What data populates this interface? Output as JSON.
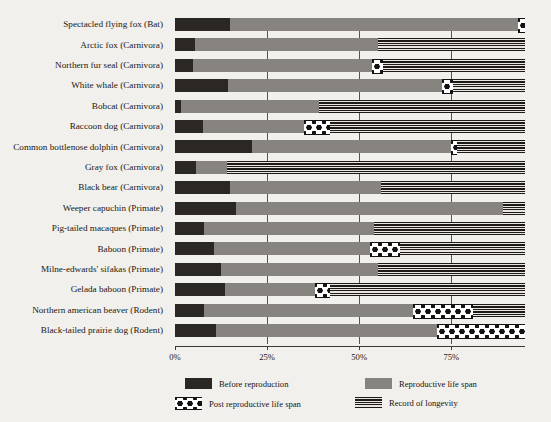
{
  "chart_data": {
    "type": "bar",
    "subtype": "stacked-horizontal",
    "title": "",
    "xlabel": "",
    "ylabel": "",
    "xlim": [
      0,
      95
    ],
    "xticks": [
      0,
      25,
      50,
      75
    ],
    "xtick_labels": [
      "0%",
      "25%",
      "50%",
      "75%"
    ],
    "grid": true,
    "legend_position": "bottom",
    "series": [
      {
        "name": "Before reproduction",
        "key": "before",
        "color": "#2b2724"
      },
      {
        "name": "Reproductive life span",
        "key": "repro",
        "color": "#87837e"
      },
      {
        "name": "Post reproductive life span",
        "key": "post",
        "color": "#ffffff"
      },
      {
        "name": "Record of longevity",
        "key": "longev",
        "color": "#1d1a17"
      }
    ],
    "categories": [
      "Spectacled flying fox (Bat)",
      "Arctic fox (Carnivora)",
      "Northern fur seal (Carnivora)",
      "White whale (Carnivora)",
      "Bobcat (Carnivora)",
      "Raccoon dog (Carnivora)",
      "Common bottlenose dolphin (Carnivora)",
      "Gray fox (Carnivora)",
      "Black bear (Carnivora)",
      "Weeper capuchin (Primate)",
      "Pig-tailed macaques (Primate)",
      "Baboon (Primate)",
      "Milne-edwards' sifakas (Primate)",
      "Gelada baboon (Primate)",
      "Northern american beaver (Rodent)",
      "Black-tailed prairie dog (Rodent)"
    ],
    "rows": [
      {
        "label": "Spectacled flying fox (Bat)",
        "before": 15.0,
        "repro": 78.0,
        "post": 2.0,
        "longev": 0.0
      },
      {
        "label": "Arctic fox (Carnivora)",
        "before": 5.5,
        "repro": 49.5,
        "post": 0.0,
        "longev": 40.0
      },
      {
        "label": "Northern fur seal (Carnivora)",
        "before": 5.0,
        "repro": 48.5,
        "post": 3.0,
        "longev": 38.5
      },
      {
        "label": "White whale (Carnivora)",
        "before": 14.5,
        "repro": 58.0,
        "post": 3.0,
        "longev": 19.5
      },
      {
        "label": "Bobcat (Carnivora)",
        "before": 1.7,
        "repro": 37.3,
        "post": 0.0,
        "longev": 56.0
      },
      {
        "label": "Raccoon dog (Carnivora)",
        "before": 7.5,
        "repro": 27.5,
        "post": 7.0,
        "longev": 53.0
      },
      {
        "label": "Common bottlenose dolphin (Carnivora)",
        "before": 21.0,
        "repro": 54.0,
        "post": 1.5,
        "longev": 18.5
      },
      {
        "label": "Gray fox (Carnivora)",
        "before": 5.7,
        "repro": 8.3,
        "post": 0.0,
        "longev": 81.0
      },
      {
        "label": "Black bear (Carnivora)",
        "before": 15.0,
        "repro": 41.0,
        "post": 0.0,
        "longev": 39.0
      },
      {
        "label": "Weeper capuchin (Primate)",
        "before": 16.6,
        "repro": 72.4,
        "post": 0.0,
        "longev": 6.0
      },
      {
        "label": "Pig-tailed macaques (Primate)",
        "before": 8.0,
        "repro": 46.0,
        "post": 0.0,
        "longev": 41.0
      },
      {
        "label": "Baboon (Primate)",
        "before": 10.6,
        "repro": 42.4,
        "post": 8.0,
        "longev": 34.0
      },
      {
        "label": "Milne-edwards' sifakas (Primate)",
        "before": 12.5,
        "repro": 42.5,
        "post": 0.0,
        "longev": 40.0
      },
      {
        "label": "Gelada baboon (Primate)",
        "before": 13.6,
        "repro": 24.4,
        "post": 4.0,
        "longev": 53.0
      },
      {
        "label": "Northern american beaver (Rodent)",
        "before": 8.0,
        "repro": 56.5,
        "post": 16.5,
        "longev": 14.0
      },
      {
        "label": "Black-tailed prairie dog (Rodent)",
        "before": 11.0,
        "repro": 60.0,
        "post": 24.0,
        "longev": 0.0
      }
    ]
  },
  "legend": {
    "items": [
      {
        "label": "Before reproduction",
        "key": "before"
      },
      {
        "label": "Reproductive life span",
        "key": "repro"
      },
      {
        "label": "Post reproductive life span",
        "key": "post"
      },
      {
        "label": "Record of longevity",
        "key": "longev"
      }
    ]
  },
  "axis": {
    "tick_labels": [
      "0%",
      "25%",
      "50%",
      "75%"
    ]
  }
}
